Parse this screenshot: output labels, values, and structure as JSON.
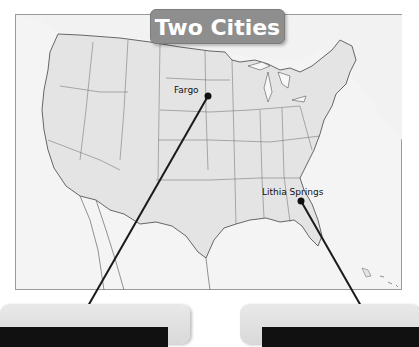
{
  "title": "Two Cities",
  "map": {
    "region": "United States",
    "frame_color": "#9a9a9a",
    "land_color": "#e3e3e3",
    "water_color": "#f4f4f4",
    "line_color": "#1a1a1a"
  },
  "cities": [
    {
      "name": "Fargo",
      "dot": [
        208,
        96
      ],
      "label_pos": [
        174,
        85
      ],
      "leader_end": [
        76,
        327
      ]
    },
    {
      "name": "Lithia Springs",
      "dot": [
        301,
        201
      ],
      "label_pos": [
        262,
        186
      ],
      "leader_end": [
        373,
        327
      ]
    }
  ],
  "info_boxes": [
    {
      "id": "fargo-box",
      "text": ""
    },
    {
      "id": "lithia-springs-box",
      "text": ""
    }
  ]
}
